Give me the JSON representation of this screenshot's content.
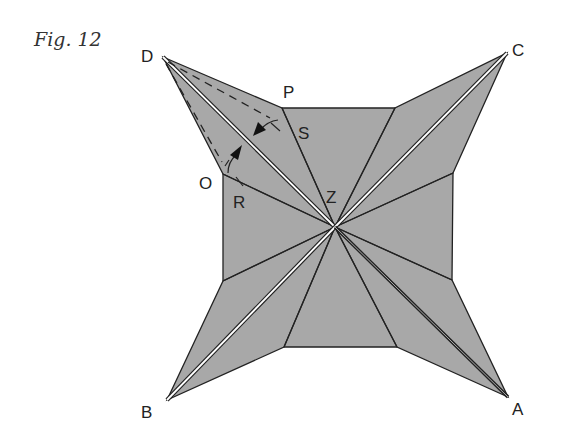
{
  "figure": {
    "caption": "Fig. 12",
    "fill_color": "#a8a8a8",
    "line_color": "#222222"
  },
  "labels": {
    "D": "D",
    "C": "C",
    "B": "B",
    "A": "A",
    "P": "P",
    "S": "S",
    "O": "O",
    "R": "R",
    "Z": "Z"
  }
}
